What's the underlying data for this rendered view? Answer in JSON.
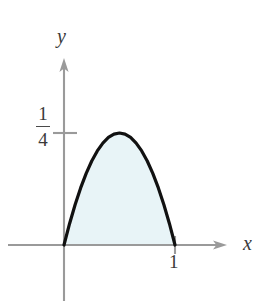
{
  "figure": {
    "name": "parabola-area-figure",
    "background_color": "#ffffff",
    "axes": {
      "x_axis_label": "x",
      "y_axis_label": "y",
      "axis_color": "#9a9a9a",
      "origin_px": [
        64,
        245
      ],
      "x_axis_start_px": 8,
      "x_axis_end_px": 227,
      "y_axis_top_px": 58,
      "y_axis_bottom_px": 301,
      "x_unit_px": 111,
      "y_unit_for_quarter_px": 112
    },
    "ticks": {
      "x": [
        {
          "label": "1",
          "value": 1,
          "px": 175
        }
      ],
      "y": [
        {
          "label_numerator": "1",
          "label_denominator": "4",
          "value": 0.25,
          "px": 133
        }
      ]
    },
    "curve": {
      "color": "#111111",
      "stroke_width": 3.2,
      "fill_color": "#e8f4f7",
      "fill_opacity": 1
    }
  },
  "chart_data": {
    "type": "line",
    "title": "",
    "subtitle": "",
    "xlabel": "x",
    "ylabel": "y",
    "xlim": [
      -0.5,
      1.45
    ],
    "ylim": [
      -0.12,
      0.42
    ],
    "grid": false,
    "legend": null,
    "annotations": [],
    "xticks": [
      1
    ],
    "xticklabels": [
      "1"
    ],
    "yticks": [
      0.25
    ],
    "yticklabels": [
      "1/4"
    ],
    "series": [
      {
        "name": "y = x(1 - x)",
        "type": "line",
        "filled_to_axis": true,
        "fill_color": "#e8f4f7",
        "line_color": "#111111",
        "x": [
          0.0,
          0.05,
          0.1,
          0.15,
          0.2,
          0.25,
          0.3,
          0.35,
          0.4,
          0.45,
          0.5,
          0.55,
          0.6,
          0.65,
          0.7,
          0.75,
          0.8,
          0.85,
          0.9,
          0.95,
          1.0
        ],
        "y": [
          0.0,
          0.0475,
          0.09,
          0.1275,
          0.16,
          0.1875,
          0.21,
          0.2275,
          0.24,
          0.2475,
          0.25,
          0.2475,
          0.24,
          0.2275,
          0.21,
          0.1875,
          0.16,
          0.1275,
          0.09,
          0.0475,
          0.0
        ]
      }
    ],
    "shaded_region": {
      "description": "area between curve and x-axis",
      "x_from": 0,
      "x_to": 1,
      "color": "#e8f4f7"
    }
  }
}
